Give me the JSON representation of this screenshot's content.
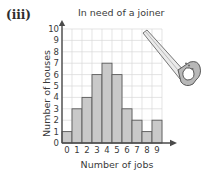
{
  "figure": {
    "part_label": "(iii)"
  },
  "chart_data": {
    "type": "bar",
    "title": "In need of a joiner",
    "xlabel": "Number of jobs",
    "ylabel": "Number of houses",
    "categories": [
      "0",
      "1",
      "2",
      "3",
      "4",
      "5",
      "6",
      "7",
      "8",
      "9"
    ],
    "values": [
      1,
      3,
      4,
      6,
      7,
      6,
      3,
      2,
      1,
      2
    ],
    "ylim": [
      0,
      10
    ],
    "yticks": [
      "0",
      "1",
      "2",
      "3",
      "4",
      "5",
      "6",
      "7",
      "8",
      "9",
      "10"
    ],
    "grid": true,
    "legend": null,
    "bar_fill": "#c9c9c9",
    "bar_stroke": "#5a5a5a",
    "grid_color": "#d8d8d8",
    "axis_color": "#4a4a4a",
    "background": "#ffffff"
  },
  "decoration": {
    "saw_icon_label": "handsaw-illustration"
  }
}
